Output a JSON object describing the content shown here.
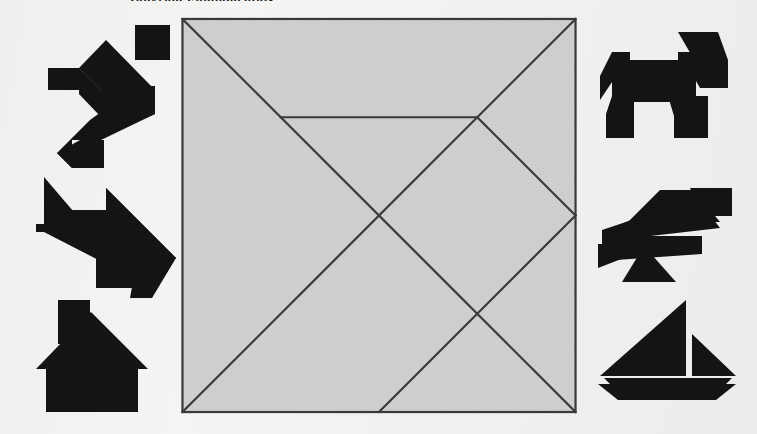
{
  "page": {
    "heading": "Tangram Fundamentals",
    "background_color": "#f1f1ef",
    "ink_color": "#141414",
    "board_fill_color": "#d6d6d4",
    "board_stroke_color": "#3a3a3a"
  },
  "board": {
    "name": "tangram-square",
    "label": "Tangram dissection square",
    "size_px": 394,
    "piece_count": 7,
    "unit_grid": 8,
    "pieces": [
      {
        "id": "large-triangle-1",
        "label": "Large triangle (lower left)",
        "points": "0,0 0,8 8,8"
      },
      {
        "id": "large-triangle-2",
        "label": "Large triangle (upper right)",
        "points": "0,0 8,8 8,0"
      },
      {
        "id": "medium-triangle",
        "label": "Medium triangle (right)",
        "points": "8,4 8,8 4,8"
      },
      {
        "id": "small-triangle-1",
        "label": "Small triangle (top)",
        "points": "2,2 6,2 4,4"
      },
      {
        "id": "small-triangle-2",
        "label": "Small triangle (center right)",
        "points": "4,4 6,2 6,6"
      },
      {
        "id": "square",
        "label": "Square piece",
        "points": "4,4 6,6 4,8 2,6"
      },
      {
        "id": "parallelogram",
        "label": "Parallelogram",
        "points": "6,2 8,2 8,4 6,6"
      }
    ],
    "cut_lines": [
      {
        "id": "cut-main-diagonal",
        "from": "0,0",
        "to": "8,8"
      },
      {
        "id": "cut-anti-diagonal",
        "from": "8,0",
        "to": "0,8"
      },
      {
        "id": "cut-horizontal-top",
        "from": "2,2",
        "to": "6,2"
      },
      {
        "id": "cut-small-right",
        "from": "6,2",
        "to": "8,4"
      },
      {
        "id": "cut-medium-right",
        "from": "8,4",
        "to": "4,8"
      }
    ]
  },
  "figures": {
    "left_column_label": "Left figures",
    "right_column_label": "Right figures",
    "items": [
      {
        "id": "figure-runner",
        "name": "runner-figure",
        "label": "Running person",
        "side": "left",
        "x": 38,
        "y": 22,
        "w": 132,
        "h": 132
      },
      {
        "id": "figure-arrow",
        "name": "arrow-figure",
        "label": "Arrow pointing down-right",
        "side": "left",
        "x": 34,
        "y": 170,
        "w": 140,
        "h": 116
      },
      {
        "id": "figure-house",
        "name": "house-figure",
        "label": "House with chimney",
        "side": "left",
        "x": 36,
        "y": 296,
        "w": 110,
        "h": 114
      },
      {
        "id": "figure-dog",
        "name": "dog-figure",
        "label": "Dog",
        "side": "right",
        "x": 600,
        "y": 30,
        "w": 126,
        "h": 106
      },
      {
        "id": "figure-bird",
        "name": "bird-figure",
        "label": "Bird",
        "side": "right",
        "x": 598,
        "y": 188,
        "w": 132,
        "h": 92
      },
      {
        "id": "figure-boat",
        "name": "sailboat-figure",
        "label": "Sailboat",
        "side": "right",
        "x": 598,
        "y": 298,
        "w": 136,
        "h": 100
      }
    ]
  },
  "chart_data": {
    "type": "diagram",
    "elements": 7,
    "surrounding_figures": 6
  }
}
